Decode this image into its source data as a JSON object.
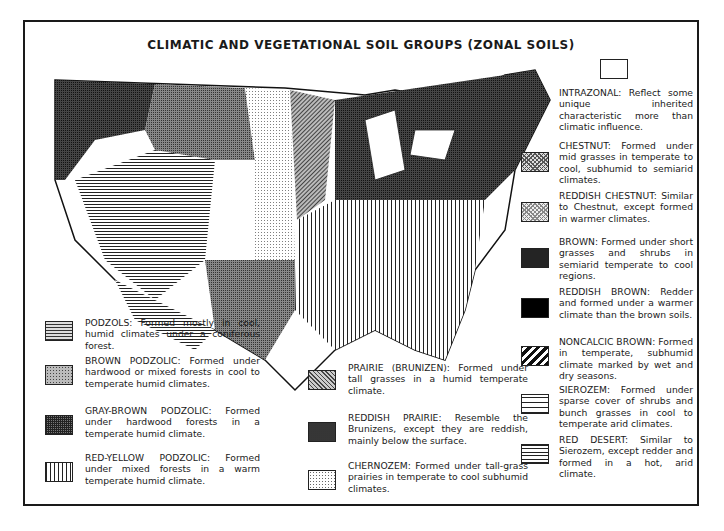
{
  "title": "CLIMATIC AND VEGETATIONAL SOIL GROUPS (ZONAL SOILS)",
  "map": {
    "subject": "Soil groups of the contiguous United States",
    "pattern_colors": {
      "ink": "#1a1a1a",
      "paper": "#ffffff"
    }
  },
  "legend_left": [
    {
      "id": "podzols",
      "name": "PODZOLS",
      "text": "PODZOLS: Formed mostly in cool, humid climates under a coniferous forest."
    },
    {
      "id": "brown-podzolic",
      "name": "BROWN PODZOLIC",
      "text": "BROWN PODZOLIC: Formed under hardwood or mixed forests in cool to temperate humid climates."
    },
    {
      "id": "gray-brown",
      "name": "GRAY-BROWN PODZOLIC",
      "text": "GRAY-BROWN PODZOLIC: Formed under hardwood forests in a temperate humid climate."
    },
    {
      "id": "red-yellow",
      "name": "RED-YELLOW PODZOLIC",
      "text": "RED-YELLOW PODZOLIC: Formed under mixed forests in a warm temperate humid climate."
    }
  ],
  "legend_middle": [
    {
      "id": "prairie",
      "name": "PRAIRIE (BRUNIZEN)",
      "text": "PRAIRIE (BRUNIZEN): Formed under tall grasses in a humid temperate climate."
    },
    {
      "id": "reddish-prairie",
      "name": "REDDISH PRAIRIE",
      "text": "REDDISH PRAIRIE: Resemble the Brunizens, except they are reddish, mainly below the surface."
    },
    {
      "id": "chernozem",
      "name": "CHERNOZEM",
      "text": "CHERNOZEM: Formed under tall-grass prairies in temperate to cool subhumid climates."
    }
  ],
  "legend_right": [
    {
      "id": "intrazonal",
      "name": "INTRAZONAL",
      "text": "INTRAZONAL: Reflect some unique inherited characteristic more than climatic influence."
    },
    {
      "id": "chestnut",
      "name": "CHESTNUT",
      "text": "CHESTNUT: Formed under mid grasses in temperate to cool, subhumid to semiarid climates."
    },
    {
      "id": "reddish-chestnut",
      "name": "REDDISH CHESTNUT",
      "text": "REDDISH CHESTNUT: Similar to Chestnut, except formed in warmer climates."
    },
    {
      "id": "brown",
      "name": "BROWN",
      "text": "BROWN: Formed under short grasses and shrubs in semiarid temperate to cool regions."
    },
    {
      "id": "reddish-brown",
      "name": "REDDISH BROWN",
      "text": "REDDISH BROWN: Redder and formed under a warmer climate than the brown soils."
    },
    {
      "id": "noncalcic",
      "name": "NONCALCIC BROWN",
      "text": "NONCALCIC BROWN: Formed in temperate, subhumid climate marked by wet and dry seasons."
    },
    {
      "id": "sierozem",
      "name": "SIEROZEM",
      "text": "SIEROZEM: Formed under sparse cover of shrubs and bunch grasses in cool to temperate arid climates."
    },
    {
      "id": "red-desert",
      "name": "RED DESERT",
      "text": "RED DESERT: Similar to Sierozem, except redder and formed in a hot, arid climate."
    }
  ]
}
